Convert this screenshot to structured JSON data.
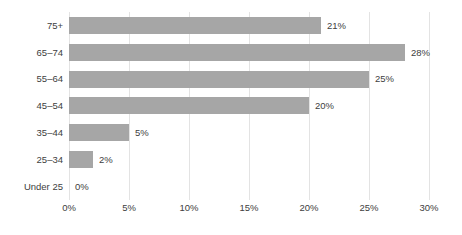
{
  "chart_data": {
    "type": "bar",
    "orientation": "horizontal",
    "title": "",
    "subtitle": "",
    "xlabel": "",
    "ylabel": "",
    "categories": [
      "75+",
      "65–74",
      "55–64",
      "45–54",
      "35–44",
      "25–34",
      "Under 25"
    ],
    "values": [
      21,
      28,
      25,
      20,
      5,
      2,
      0
    ],
    "data_labels": [
      "21%",
      "28%",
      "25%",
      "20%",
      "5%",
      "2%",
      "0%"
    ],
    "xlim": [
      0,
      30
    ],
    "xticks": [
      0,
      5,
      10,
      15,
      20,
      25,
      30
    ],
    "xtick_labels": [
      "0%",
      "5%",
      "10%",
      "15%",
      "20%",
      "25%",
      "30%"
    ],
    "grid": "vertical",
    "legend": "none",
    "series": [
      {
        "name": "",
        "values": [
          21,
          28,
          25,
          20,
          5,
          2,
          0
        ]
      }
    ]
  },
  "style": {
    "bar_color": "#a6a6a6",
    "text_color": "#404040",
    "gridline_color": "#e3e3e3",
    "background_color": "#ffffff"
  }
}
